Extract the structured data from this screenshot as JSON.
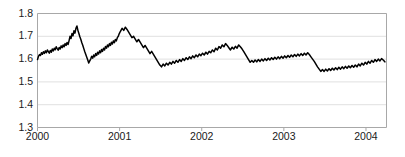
{
  "chart_data": {
    "type": "line",
    "title": "",
    "xlabel": "",
    "ylabel": "",
    "ylim": [
      1.3,
      1.8
    ],
    "xlim": [
      2000.0,
      2004.25
    ],
    "grid": true,
    "legend": null,
    "y_ticks": [
      "1.8",
      "1.7",
      "1.6",
      "1.5",
      "1.4",
      "1.3"
    ],
    "y_tick_values": [
      1.8,
      1.7,
      1.6,
      1.5,
      1.4,
      1.3
    ],
    "x_ticks": [
      "2000",
      "2001",
      "2002",
      "2003",
      "2004"
    ],
    "x_tick_values": [
      2000,
      2001,
      2002,
      2003,
      2004
    ],
    "line_color": "#000000",
    "grid_color": "#e0e0e0",
    "frame_color": "#a8a8a8",
    "series": [
      {
        "name": "rate",
        "x": [
          2000.0,
          2000.012,
          2000.024,
          2000.036,
          2000.048,
          2000.06,
          2000.072,
          2000.084,
          2000.096,
          2000.108,
          2000.12,
          2000.132,
          2000.144,
          2000.156,
          2000.168,
          2000.18,
          2000.192,
          2000.204,
          2000.216,
          2000.228,
          2000.24,
          2000.252,
          2000.264,
          2000.276,
          2000.288,
          2000.3,
          2000.312,
          2000.324,
          2000.336,
          2000.348,
          2000.36,
          2000.372,
          2000.384,
          2000.396,
          2000.408,
          2000.42,
          2000.432,
          2000.444,
          2000.456,
          2000.468,
          2000.48,
          2000.492,
          2000.504,
          2000.516,
          2000.528,
          2000.54,
          2000.552,
          2000.564,
          2000.576,
          2000.588,
          2000.6,
          2000.612,
          2000.624,
          2000.636,
          2000.648,
          2000.66,
          2000.672,
          2000.684,
          2000.696,
          2000.708,
          2000.72,
          2000.732,
          2000.744,
          2000.756,
          2000.768,
          2000.78,
          2000.792,
          2000.804,
          2000.816,
          2000.828,
          2000.84,
          2000.852,
          2000.864,
          2000.876,
          2000.888,
          2000.9,
          2000.912,
          2000.924,
          2000.936,
          2000.948,
          2000.96,
          2000.972,
          2000.984,
          2000.996,
          2001.01,
          2001.03,
          2001.05,
          2001.07,
          2001.09,
          2001.11,
          2001.13,
          2001.15,
          2001.17,
          2001.19,
          2001.21,
          2001.23,
          2001.25,
          2001.27,
          2001.29,
          2001.31,
          2001.33,
          2001.35,
          2001.37,
          2001.39,
          2001.41,
          2001.43,
          2001.45,
          2001.47,
          2001.49,
          2001.51,
          2001.53,
          2001.55,
          2001.57,
          2001.59,
          2001.61,
          2001.63,
          2001.65,
          2001.67,
          2001.69,
          2001.71,
          2001.73,
          2001.75,
          2001.77,
          2001.79,
          2001.81,
          2001.83,
          2001.85,
          2001.87,
          2001.89,
          2001.91,
          2001.93,
          2001.95,
          2001.97,
          2001.99,
          2002.01,
          2002.03,
          2002.05,
          2002.07,
          2002.09,
          2002.11,
          2002.13,
          2002.15,
          2002.17,
          2002.19,
          2002.21,
          2002.23,
          2002.25,
          2002.27,
          2002.29,
          2002.31,
          2002.33,
          2002.35,
          2002.37,
          2002.39,
          2002.41,
          2002.43,
          2002.45,
          2002.47,
          2002.49,
          2002.51,
          2002.53,
          2002.55,
          2002.57,
          2002.59,
          2002.61,
          2002.63,
          2002.65,
          2002.67,
          2002.69,
          2002.71,
          2002.73,
          2002.75,
          2002.77,
          2002.79,
          2002.81,
          2002.83,
          2002.85,
          2002.87,
          2002.89,
          2002.91,
          2002.93,
          2002.95,
          2002.97,
          2002.99,
          2003.01,
          2003.03,
          2003.05,
          2003.07,
          2003.09,
          2003.11,
          2003.13,
          2003.15,
          2003.17,
          2003.19,
          2003.21,
          2003.23,
          2003.25,
          2003.27,
          2003.29,
          2003.31,
          2003.33,
          2003.35,
          2003.37,
          2003.39,
          2003.41,
          2003.43,
          2003.45,
          2003.47,
          2003.49,
          2003.51,
          2003.53,
          2003.55,
          2003.57,
          2003.59,
          2003.61,
          2003.63,
          2003.65,
          2003.67,
          2003.69,
          2003.71,
          2003.73,
          2003.75,
          2003.77,
          2003.79,
          2003.81,
          2003.83,
          2003.85,
          2003.87,
          2003.89,
          2003.91,
          2003.93,
          2003.95,
          2003.97,
          2003.99,
          2004.01,
          2004.03,
          2004.05,
          2004.07,
          2004.09,
          2004.11,
          2004.13,
          2004.15,
          2004.17,
          2004.19,
          2004.21,
          2004.23
        ],
        "values": [
          1.598,
          1.612,
          1.62,
          1.616,
          1.628,
          1.621,
          1.632,
          1.625,
          1.636,
          1.628,
          1.64,
          1.633,
          1.626,
          1.638,
          1.63,
          1.644,
          1.636,
          1.648,
          1.641,
          1.654,
          1.646,
          1.639,
          1.651,
          1.644,
          1.658,
          1.65,
          1.662,
          1.654,
          1.668,
          1.66,
          1.673,
          1.664,
          1.68,
          1.7,
          1.69,
          1.712,
          1.702,
          1.724,
          1.714,
          1.735,
          1.745,
          1.726,
          1.712,
          1.698,
          1.686,
          1.672,
          1.66,
          1.646,
          1.632,
          1.62,
          1.608,
          1.596,
          1.583,
          1.592,
          1.6,
          1.612,
          1.604,
          1.618,
          1.61,
          1.624,
          1.616,
          1.63,
          1.622,
          1.636,
          1.628,
          1.642,
          1.634,
          1.648,
          1.64,
          1.655,
          1.648,
          1.662,
          1.654,
          1.668,
          1.66,
          1.674,
          1.666,
          1.68,
          1.672,
          1.686,
          1.68,
          1.694,
          1.7,
          1.712,
          1.722,
          1.735,
          1.726,
          1.74,
          1.73,
          1.718,
          1.706,
          1.694,
          1.7,
          1.688,
          1.676,
          1.686,
          1.674,
          1.662,
          1.65,
          1.66,
          1.648,
          1.636,
          1.624,
          1.634,
          1.622,
          1.61,
          1.598,
          1.586,
          1.574,
          1.566,
          1.578,
          1.57,
          1.582,
          1.574,
          1.586,
          1.578,
          1.59,
          1.582,
          1.594,
          1.586,
          1.598,
          1.59,
          1.602,
          1.594,
          1.606,
          1.598,
          1.61,
          1.602,
          1.614,
          1.606,
          1.618,
          1.61,
          1.622,
          1.615,
          1.626,
          1.618,
          1.63,
          1.622,
          1.634,
          1.628,
          1.64,
          1.632,
          1.648,
          1.64,
          1.655,
          1.648,
          1.662,
          1.654,
          1.668,
          1.66,
          1.65,
          1.64,
          1.652,
          1.644,
          1.656,
          1.648,
          1.662,
          1.654,
          1.645,
          1.634,
          1.622,
          1.61,
          1.598,
          1.586,
          1.594,
          1.586,
          1.596,
          1.588,
          1.598,
          1.59,
          1.6,
          1.592,
          1.602,
          1.594,
          1.604,
          1.596,
          1.606,
          1.598,
          1.608,
          1.6,
          1.61,
          1.602,
          1.612,
          1.604,
          1.614,
          1.606,
          1.616,
          1.608,
          1.618,
          1.61,
          1.62,
          1.612,
          1.622,
          1.614,
          1.624,
          1.616,
          1.626,
          1.618,
          1.628,
          1.62,
          1.61,
          1.6,
          1.59,
          1.578,
          1.566,
          1.556,
          1.546,
          1.554,
          1.546,
          1.556,
          1.548,
          1.558,
          1.55,
          1.56,
          1.552,
          1.562,
          1.554,
          1.564,
          1.556,
          1.566,
          1.558,
          1.568,
          1.56,
          1.57,
          1.562,
          1.572,
          1.564,
          1.574,
          1.566,
          1.578,
          1.57,
          1.582,
          1.574,
          1.586,
          1.578,
          1.59,
          1.582,
          1.594,
          1.586,
          1.598,
          1.59,
          1.6,
          1.592,
          1.602,
          1.596,
          1.588
        ]
      }
    ],
    "notes": {
      "description": "Daily exchange-rate style series declining from about 1.60 in 2000 to about 1.48 in early 2004",
      "max_value": 1.745,
      "min_value": 1.385,
      "start_value": 1.598,
      "end_value": 1.487
    }
  }
}
